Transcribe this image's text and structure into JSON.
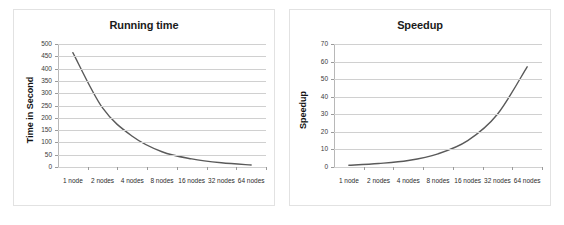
{
  "figure": {
    "background": "#ffffff",
    "border_color": "#e2e2e2",
    "line_color": "#5a5a5a",
    "grid_color": "#d0d0d0"
  },
  "charts": [
    {
      "id": "running-time",
      "title": "Running time",
      "ylabel": "Time in Second",
      "xlabel": ""
    },
    {
      "id": "speedup",
      "title": "Speedup",
      "ylabel": "Speedup",
      "xlabel": ""
    }
  ],
  "chart_data": [
    {
      "type": "line",
      "title": "Running time",
      "xlabel": "",
      "ylabel": "Time in Second",
      "categories": [
        "1 node",
        "2 nodes",
        "4 nodes",
        "8 nodes",
        "16 nodes",
        "32 nodes",
        "64 nodes"
      ],
      "values": [
        465,
        240,
        125,
        62,
        33,
        17,
        8
      ],
      "ylim": [
        0,
        500
      ],
      "yticks": [
        0,
        50,
        100,
        150,
        200,
        250,
        300,
        350,
        400,
        450,
        500
      ],
      "grid": true,
      "legend": "none",
      "series_color": "#5a5a5a"
    },
    {
      "type": "line",
      "title": "Speedup",
      "xlabel": "",
      "ylabel": "Speedup",
      "categories": [
        "1 node",
        "2 nodes",
        "4 nodes",
        "8 nodes",
        "16 nodes",
        "32 nodes",
        "64 nodes"
      ],
      "values": [
        1,
        2,
        3.7,
        7.5,
        15,
        30,
        57
      ],
      "ylim": [
        0,
        70
      ],
      "yticks": [
        0,
        10,
        20,
        30,
        40,
        50,
        60,
        70
      ],
      "grid": true,
      "legend": "none",
      "series_color": "#5a5a5a"
    }
  ]
}
